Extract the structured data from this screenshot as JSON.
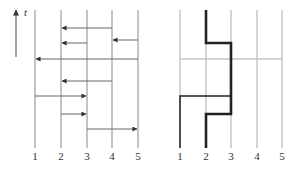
{
  "left_panel": {
    "time_axis": {
      "label": "t",
      "x": 16,
      "y_top": 8,
      "y_bottom": 57
    },
    "lanes": [
      {
        "label": "1",
        "x": 35
      },
      {
        "label": "2",
        "x": 61
      },
      {
        "label": "3",
        "x": 87
      },
      {
        "label": "4",
        "x": 112
      },
      {
        "label": "5",
        "x": 138
      }
    ],
    "lane_top": 10,
    "lane_bottom": 148,
    "label_y": 160,
    "arrows": [
      {
        "from": 4,
        "to": 2,
        "y": 28
      },
      {
        "from": 5,
        "to": 4,
        "y": 40
      },
      {
        "from": 3,
        "to": 2,
        "y": 43
      },
      {
        "from": 5,
        "to": 1,
        "y": 59
      },
      {
        "from": 4,
        "to": 2,
        "y": 81
      },
      {
        "from": 1,
        "to": 3,
        "y": 96
      },
      {
        "from": 2,
        "to": 3,
        "y": 114
      },
      {
        "from": 3,
        "to": 5,
        "y": 129
      }
    ]
  },
  "right_panel": {
    "lanes": [
      {
        "label": "1",
        "x": 180
      },
      {
        "label": "2",
        "x": 206
      },
      {
        "label": "3",
        "x": 231
      },
      {
        "label": "4",
        "x": 257
      },
      {
        "label": "5",
        "x": 282
      }
    ],
    "lane_top": 10,
    "lane_bottom": 148,
    "label_y": 160,
    "gray_line_y": 59,
    "thick_path": "206,148 206,114 231,114 231,43 206,43 206,10",
    "thin_path": "180,148 180,96 231,96",
    "colors": {
      "lane": "#aaaaaa",
      "path": "#222222",
      "gray": "#c4c4c4",
      "arrow": "#555555"
    }
  }
}
